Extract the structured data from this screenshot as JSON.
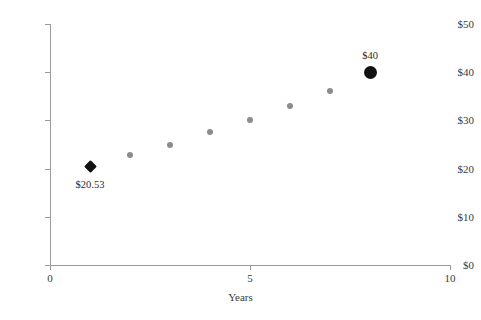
{
  "chart_data": {
    "type": "scatter",
    "title": "",
    "xlabel": "Years",
    "ylabel": "",
    "xlim": [
      0,
      10
    ],
    "ylim": [
      0,
      50
    ],
    "grid": false,
    "legend": "none",
    "x_ticks": [
      "0",
      "5",
      "10"
    ],
    "x_tick_values": [
      0,
      5,
      10
    ],
    "y_ticks": [
      "$0",
      "$10",
      "$20",
      "$30",
      "$40",
      "$50"
    ],
    "y_tick_values": [
      0,
      10,
      20,
      30,
      40,
      50
    ],
    "x": [
      1,
      2,
      3,
      4,
      5,
      6,
      7,
      8
    ],
    "values": [
      20.53,
      22.9,
      25.0,
      27.5,
      30.1,
      33.0,
      36.2,
      40.0
    ],
    "point_styles": [
      "diamond-black",
      "dot-gray",
      "dot-gray",
      "dot-gray",
      "dot-gray",
      "dot-gray",
      "dot-gray",
      "circle-black"
    ],
    "annotations": [
      {
        "text": "$20.53",
        "x": 1,
        "y": 20.53,
        "position": "below"
      },
      {
        "text": "$40",
        "x": 8,
        "y": 40.0,
        "position": "above"
      }
    ],
    "colors": {
      "marker_default": "#8c8c8c",
      "marker_emphasis": "#111111",
      "axis": "#9a9a9a",
      "text": "#2b2b2b",
      "background": "#ffffff"
    }
  }
}
